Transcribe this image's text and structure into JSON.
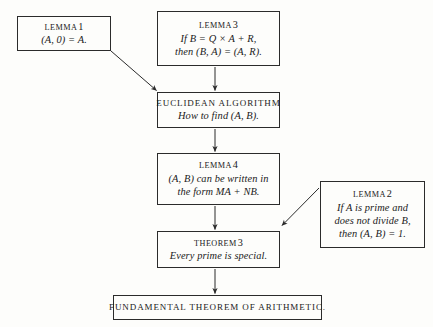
{
  "diagram": {
    "background_color": "#fdfdfb",
    "ink_color": "#2b2b2b",
    "nodes": [
      {
        "id": "lemma1",
        "header_label": "LEMMA",
        "header_number": "1",
        "lines": [
          "(A, 0) = A."
        ],
        "x": 17,
        "y": 16,
        "w": 94,
        "h": 35
      },
      {
        "id": "lemma3",
        "header_label": "LEMMA",
        "header_number": "3",
        "lines": [
          "If B = Q × A + R,",
          "then (B, A) = (A, R)."
        ],
        "x": 157,
        "y": 11,
        "w": 123,
        "h": 55
      },
      {
        "id": "euclidean",
        "header_label": "EUCLIDEAN ALGORITHM",
        "header_number": "",
        "lines": [
          "How to find (A, B)."
        ],
        "x": 157,
        "y": 92,
        "w": 123,
        "h": 36
      },
      {
        "id": "lemma4",
        "header_label": "LEMMA",
        "header_number": "4",
        "lines": [
          "(A, B) can be written in",
          "the form MA + NB."
        ],
        "x": 157,
        "y": 153,
        "w": 123,
        "h": 52
      },
      {
        "id": "lemma2",
        "header_label": "LEMMA",
        "header_number": "2",
        "lines": [
          "If A is prime and",
          "does not divide B,",
          "then (A, B) = 1."
        ],
        "x": 320,
        "y": 181,
        "w": 105,
        "h": 67
      },
      {
        "id": "theorem3",
        "header_label": "THEOREM",
        "header_number": "3",
        "lines": [
          "Every prime is special."
        ],
        "x": 157,
        "y": 231,
        "w": 123,
        "h": 37
      },
      {
        "id": "fundamental",
        "header_label": "FUNDAMENTAL THEOREM OF ARITHMETIC.",
        "header_number": "",
        "lines": [],
        "x": 113,
        "y": 295,
        "w": 209,
        "h": 25
      }
    ],
    "edges": [
      {
        "id": "edge-lemma1-to-euclidean",
        "from": "lemma1",
        "to": "euclidean",
        "kind": "diagonal"
      },
      {
        "id": "edge-lemma3-to-euclidean",
        "from": "lemma3",
        "to": "euclidean",
        "kind": "vertical"
      },
      {
        "id": "edge-euclidean-to-lemma4",
        "from": "euclidean",
        "to": "lemma4",
        "kind": "vertical"
      },
      {
        "id": "edge-lemma4-to-theorem3",
        "from": "lemma4",
        "to": "theorem3",
        "kind": "vertical"
      },
      {
        "id": "edge-lemma2-to-theorem3",
        "from": "lemma2",
        "to": "theorem3",
        "kind": "diagonal"
      },
      {
        "id": "edge-theorem3-to-fundamental",
        "from": "theorem3",
        "to": "fundamental",
        "kind": "vertical"
      }
    ]
  }
}
